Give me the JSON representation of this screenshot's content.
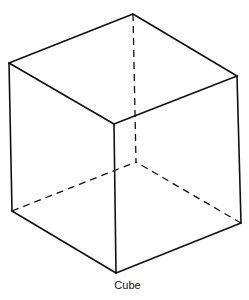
{
  "figure": {
    "caption": "Cube",
    "vertices": {
      "top_back": [
        133,
        14
      ],
      "top_left": [
        9,
        63
      ],
      "top_right": [
        237,
        76
      ],
      "top_front": [
        114,
        124
      ],
      "bottom_left": [
        12,
        211
      ],
      "bottom_right": [
        241,
        223
      ],
      "bottom_front": [
        116,
        273
      ],
      "bottom_back": [
        136,
        162
      ]
    },
    "visible_edges": [
      [
        "top_back",
        "top_left"
      ],
      [
        "top_back",
        "top_right"
      ],
      [
        "top_left",
        "top_front"
      ],
      [
        "top_right",
        "top_front"
      ],
      [
        "top_left",
        "bottom_left"
      ],
      [
        "top_right",
        "bottom_right"
      ],
      [
        "top_front",
        "bottom_front"
      ],
      [
        "bottom_left",
        "bottom_front"
      ],
      [
        "bottom_right",
        "bottom_front"
      ]
    ],
    "hidden_edges": [
      [
        "top_back",
        "bottom_back"
      ],
      [
        "bottom_left",
        "bottom_back"
      ],
      [
        "bottom_right",
        "bottom_back"
      ]
    ],
    "colors": {
      "line": "#111111",
      "background": "#ffffff"
    }
  }
}
